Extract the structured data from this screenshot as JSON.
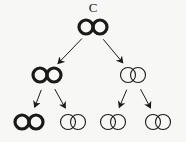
{
  "title_label": "C",
  "colors": {
    "background": "#f7f7f5",
    "stroke": "#1a1a1a"
  },
  "nodes": [
    {
      "id": "root",
      "level": 0,
      "style": "thick",
      "cx": 93,
      "cy": 27
    },
    {
      "id": "l1-left",
      "level": 1,
      "style": "thick",
      "cx": 47,
      "cy": 75
    },
    {
      "id": "l1-right",
      "level": 1,
      "style": "thin",
      "cx": 133,
      "cy": 75
    },
    {
      "id": "l2-1",
      "level": 2,
      "style": "thick",
      "cx": 29,
      "cy": 122
    },
    {
      "id": "l2-2",
      "level": 2,
      "style": "thin",
      "cx": 73,
      "cy": 122
    },
    {
      "id": "l2-3",
      "level": 2,
      "style": "thin",
      "cx": 113,
      "cy": 122
    },
    {
      "id": "l2-4",
      "level": 2,
      "style": "thin",
      "cx": 158,
      "cy": 122
    }
  ],
  "edges": [
    {
      "from": "root",
      "to": "l1-left"
    },
    {
      "from": "root",
      "to": "l1-right"
    },
    {
      "from": "l1-left",
      "to": "l2-1"
    },
    {
      "from": "l1-left",
      "to": "l2-2"
    },
    {
      "from": "l1-right",
      "to": "l2-3"
    },
    {
      "from": "l1-right",
      "to": "l2-4"
    }
  ]
}
